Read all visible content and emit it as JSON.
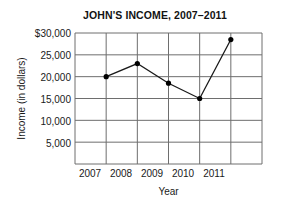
{
  "chart_data": {
    "type": "line",
    "title": "JOHN'S INCOME, 2007–2011",
    "xlabel": "Year",
    "ylabel": "Income (in dollars)",
    "categories": [
      "2007",
      "2008",
      "2009",
      "2010",
      "2011"
    ],
    "values": [
      20000,
      23000,
      18500,
      15000,
      28500
    ],
    "ylim": [
      0,
      30000
    ],
    "y_ticks": [
      5000,
      10000,
      15000,
      20000,
      25000,
      30000
    ],
    "y_tick_labels": [
      "5,000",
      "10,000",
      "15,000",
      "20,000",
      "25,000",
      "$30,000"
    ],
    "x_tick_labels": [
      "2007",
      "2008",
      "2009",
      "2010",
      "2011"
    ],
    "grid": true,
    "legend": null,
    "series": [
      {
        "name": "Income",
        "values": [
          20000,
          23000,
          18500,
          15000,
          28500
        ],
        "marker": "filled-circle",
        "color": "#000000"
      }
    ],
    "colors": {
      "line": "#1a1a1a",
      "marker": "#000000",
      "grid": "#6e6e6e",
      "frame": "#6e6e6e",
      "background": "#ffffff",
      "text": "#1a1a1a"
    }
  },
  "figure": {
    "title": "JOHN'S INCOME, 2007–2011",
    "y_axis_title": "Income (in dollars)",
    "x_axis_title": "Year",
    "y_labels": [
      "$30,000",
      "25,000",
      "20,000",
      "15,000",
      "10,000",
      "5,000"
    ],
    "x_labels": [
      "2007",
      "2008",
      "2009",
      "2010",
      "2011"
    ]
  }
}
